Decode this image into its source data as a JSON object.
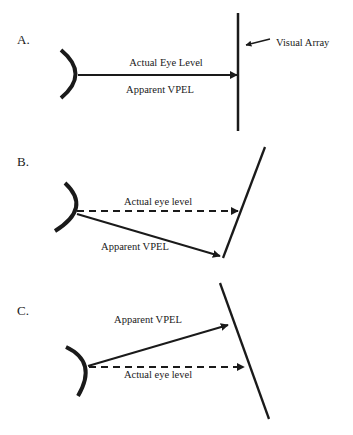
{
  "panels": [
    {
      "id": "A",
      "label": "A.",
      "actual_label": "Actual Eye Level",
      "apparent_label": "Apparent VPEL",
      "array_label": "Visual Array"
    },
    {
      "id": "B",
      "label": "B.",
      "actual_label": "Actual eye level",
      "apparent_label": "Apparent VPEL"
    },
    {
      "id": "C",
      "label": "C.",
      "apparent_label": "Apparent VPEL",
      "actual_label": "Actual eye level"
    }
  ],
  "colors": {
    "ink": "#1a1a1a",
    "background": "#ffffff"
  }
}
